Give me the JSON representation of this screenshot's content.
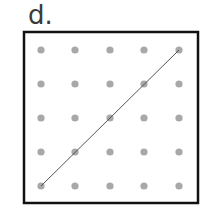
{
  "label": "d.",
  "grid": {
    "rows": 5,
    "cols": 5,
    "dot_color": "#a8a8a8",
    "frame_color": "#111111",
    "line_color": "#555555"
  },
  "segment": {
    "from": {
      "col": 0,
      "row": 4
    },
    "to": {
      "col": 4,
      "row": 0
    }
  }
}
